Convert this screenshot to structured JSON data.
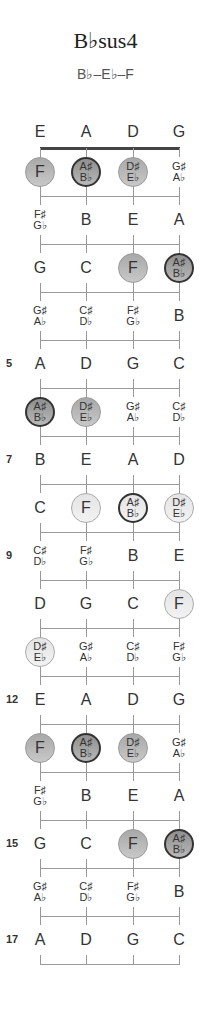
{
  "title": "B♭sus4",
  "subtitle": "B♭–E♭–F",
  "strings": [
    "E",
    "A",
    "D",
    "G"
  ],
  "fret_numbers": {
    "5": "5",
    "7": "7",
    "9": "9",
    "12": "12",
    "15": "15",
    "17": "17"
  },
  "rows": [
    {
      "fret": 0,
      "notes": [
        {
          "t": [
            "E"
          ]
        },
        {
          "t": [
            "A"
          ]
        },
        {
          "t": [
            "D"
          ]
        },
        {
          "t": [
            "G"
          ]
        }
      ]
    },
    {
      "fret": 1,
      "notes": [
        {
          "t": [
            "F"
          ],
          "hl": 1
        },
        {
          "t": [
            "A♯",
            "B♭"
          ],
          "hl": 1,
          "root": 1
        },
        {
          "t": [
            "D♯",
            "E♭"
          ],
          "hl": 1
        },
        {
          "t": [
            "G♯",
            "A♭"
          ]
        }
      ]
    },
    {
      "fret": 2,
      "notes": [
        {
          "t": [
            "F♯",
            "G♭"
          ]
        },
        {
          "t": [
            "B"
          ]
        },
        {
          "t": [
            "E"
          ]
        },
        {
          "t": [
            "A"
          ]
        }
      ]
    },
    {
      "fret": 3,
      "notes": [
        {
          "t": [
            "G"
          ]
        },
        {
          "t": [
            "C"
          ]
        },
        {
          "t": [
            "F"
          ],
          "hl": 1
        },
        {
          "t": [
            "A♯",
            "B♭"
          ],
          "hl": 1,
          "root": 1
        }
      ]
    },
    {
      "fret": 4,
      "notes": [
        {
          "t": [
            "G♯",
            "A♭"
          ]
        },
        {
          "t": [
            "C♯",
            "D♭"
          ]
        },
        {
          "t": [
            "F♯",
            "G♭"
          ]
        },
        {
          "t": [
            "B"
          ]
        }
      ]
    },
    {
      "fret": 5,
      "notes": [
        {
          "t": [
            "A"
          ]
        },
        {
          "t": [
            "D"
          ]
        },
        {
          "t": [
            "G"
          ]
        },
        {
          "t": [
            "C"
          ]
        }
      ]
    },
    {
      "fret": 6,
      "notes": [
        {
          "t": [
            "A♯",
            "B♭"
          ],
          "hl": 1,
          "root": 1
        },
        {
          "t": [
            "D♯",
            "E♭"
          ],
          "hl": 1
        },
        {
          "t": [
            "G♯",
            "A♭"
          ]
        },
        {
          "t": [
            "C♯",
            "D♭"
          ]
        }
      ]
    },
    {
      "fret": 7,
      "notes": [
        {
          "t": [
            "B"
          ]
        },
        {
          "t": [
            "E"
          ]
        },
        {
          "t": [
            "A"
          ]
        },
        {
          "t": [
            "D"
          ]
        }
      ]
    },
    {
      "fret": 8,
      "notes": [
        {
          "t": [
            "C"
          ]
        },
        {
          "t": [
            "F"
          ],
          "hl": 1,
          "light": 1
        },
        {
          "t": [
            "A♯",
            "B♭"
          ],
          "hl": 1,
          "root": 1,
          "light": 1
        },
        {
          "t": [
            "D♯",
            "E♭"
          ],
          "hl": 1,
          "light": 1
        }
      ]
    },
    {
      "fret": 9,
      "notes": [
        {
          "t": [
            "C♯",
            "D♭"
          ]
        },
        {
          "t": [
            "F♯",
            "G♭"
          ]
        },
        {
          "t": [
            "B"
          ]
        },
        {
          "t": [
            "E"
          ]
        }
      ]
    },
    {
      "fret": 10,
      "notes": [
        {
          "t": [
            "D"
          ]
        },
        {
          "t": [
            "G"
          ]
        },
        {
          "t": [
            "C"
          ]
        },
        {
          "t": [
            "F"
          ],
          "hl": 1,
          "light": 1
        }
      ]
    },
    {
      "fret": 11,
      "notes": [
        {
          "t": [
            "D♯",
            "E♭"
          ],
          "hl": 1,
          "light": 1
        },
        {
          "t": [
            "G♯",
            "A♭"
          ]
        },
        {
          "t": [
            "C♯",
            "D♭"
          ]
        },
        {
          "t": [
            "F♯",
            "G♭"
          ]
        }
      ]
    },
    {
      "fret": 12,
      "notes": [
        {
          "t": [
            "E"
          ]
        },
        {
          "t": [
            "A"
          ]
        },
        {
          "t": [
            "D"
          ]
        },
        {
          "t": [
            "G"
          ]
        }
      ]
    },
    {
      "fret": 13,
      "notes": [
        {
          "t": [
            "F"
          ],
          "hl": 1
        },
        {
          "t": [
            "A♯",
            "B♭"
          ],
          "hl": 1,
          "root": 1
        },
        {
          "t": [
            "D♯",
            "E♭"
          ],
          "hl": 1
        },
        {
          "t": [
            "G♯",
            "A♭"
          ]
        }
      ]
    },
    {
      "fret": 14,
      "notes": [
        {
          "t": [
            "F♯",
            "G♭"
          ]
        },
        {
          "t": [
            "B"
          ]
        },
        {
          "t": [
            "E"
          ]
        },
        {
          "t": [
            "A"
          ]
        }
      ]
    },
    {
      "fret": 15,
      "notes": [
        {
          "t": [
            "G"
          ]
        },
        {
          "t": [
            "C"
          ]
        },
        {
          "t": [
            "F"
          ],
          "hl": 1
        },
        {
          "t": [
            "A♯",
            "B♭"
          ],
          "hl": 1,
          "root": 1
        }
      ]
    },
    {
      "fret": 16,
      "notes": [
        {
          "t": [
            "G♯",
            "A♭"
          ]
        },
        {
          "t": [
            "C♯",
            "D♭"
          ]
        },
        {
          "t": [
            "F♯",
            "G♭"
          ]
        },
        {
          "t": [
            "B"
          ]
        }
      ]
    },
    {
      "fret": 17,
      "notes": [
        {
          "t": [
            "A"
          ]
        },
        {
          "t": [
            "D"
          ]
        },
        {
          "t": [
            "G"
          ]
        },
        {
          "t": [
            "C"
          ]
        }
      ]
    }
  ]
}
